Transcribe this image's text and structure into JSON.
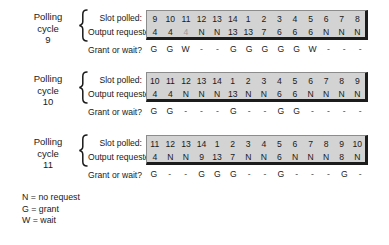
{
  "figure": {
    "row_captions": {
      "slot_polled": "Slot polled:",
      "output_requested": "Output requested:",
      "grant_or_wait": "Grant or wait?"
    },
    "cycle_label_prefix_line1": "Polling",
    "cycle_label_prefix_line2": "cycle"
  },
  "cycles": [
    {
      "label_line1": "Polling",
      "label_line2": "cycle",
      "number": "9",
      "slot_polled": [
        "9",
        "10",
        "11",
        "12",
        "13",
        "14",
        "1",
        "2",
        "3",
        "4",
        "5",
        "6",
        "7",
        "8"
      ],
      "output_requested": [
        "4",
        "4",
        "4",
        "N",
        "N",
        "13",
        "13",
        "7",
        "6",
        "6",
        "6",
        "N",
        "N",
        "N"
      ],
      "output_requested_dim": [
        false,
        false,
        true,
        false,
        false,
        false,
        false,
        false,
        false,
        false,
        false,
        false,
        false,
        false
      ],
      "grant_or_wait": [
        "G",
        "G",
        "W",
        "-",
        "-",
        "G",
        "G",
        "G",
        "G",
        "G",
        "W",
        "-",
        "-",
        "-"
      ]
    },
    {
      "label_line1": "Polling",
      "label_line2": "cycle",
      "number": "10",
      "slot_polled": [
        "10",
        "11",
        "12",
        "13",
        "14",
        "1",
        "2",
        "3",
        "4",
        "5",
        "6",
        "7",
        "8",
        "9"
      ],
      "output_requested": [
        "4",
        "4",
        "N",
        "N",
        "N",
        "13",
        "N",
        "N",
        "6",
        "6",
        "N",
        "N",
        "N",
        "N"
      ],
      "output_requested_dim": [
        false,
        false,
        false,
        false,
        false,
        false,
        false,
        false,
        false,
        false,
        false,
        false,
        false,
        false
      ],
      "grant_or_wait": [
        "G",
        "G",
        "-",
        "-",
        "-",
        "G",
        "-",
        "-",
        "G",
        "G",
        "-",
        "-",
        "-",
        "-"
      ]
    },
    {
      "label_line1": "Polling",
      "label_line2": "cycle",
      "number": "11",
      "slot_polled": [
        "11",
        "12",
        "13",
        "14",
        "1",
        "2",
        "3",
        "4",
        "5",
        "6",
        "7",
        "8",
        "9",
        "10"
      ],
      "output_requested": [
        "4",
        "N",
        "N",
        "9",
        "13",
        "7",
        "N",
        "N",
        "6",
        "N",
        "N",
        "N",
        "8",
        "N"
      ],
      "output_requested_dim": [
        false,
        false,
        false,
        false,
        false,
        false,
        false,
        false,
        false,
        false,
        false,
        false,
        false,
        false
      ],
      "grant_or_wait": [
        "G",
        "-",
        "-",
        "G",
        "G",
        "G",
        "-",
        "-",
        "G",
        "-",
        "-",
        "-",
        "G",
        "-"
      ]
    }
  ],
  "legend": [
    "N = no request",
    "G = grant",
    "W = wait"
  ]
}
